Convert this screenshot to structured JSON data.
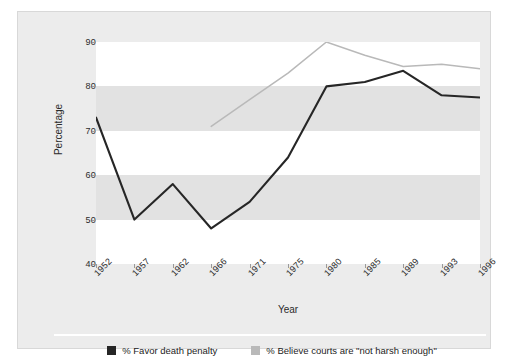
{
  "chart_data": {
    "type": "line",
    "title": "",
    "xlabel": "Year",
    "ylabel": "Percentage",
    "categories": [
      "1952",
      "1957",
      "1962",
      "1966",
      "1971",
      "1975",
      "1980",
      "1985",
      "1989",
      "1993",
      "1996"
    ],
    "ylim": [
      40,
      90
    ],
    "yticks": [
      40,
      50,
      60,
      70,
      80,
      90
    ],
    "grid": "horizontal-bands",
    "legend_position": "bottom",
    "series": [
      {
        "name": "% Favor death penalty",
        "color": "#262626",
        "values": [
          73,
          50,
          58,
          48,
          54,
          64,
          80,
          81,
          83.5,
          78,
          77.5
        ]
      },
      {
        "name": "% Believe courts are \"not harsh enough\"",
        "color": "#b9b9b9",
        "values": [
          null,
          null,
          null,
          71,
          77,
          83,
          90,
          87,
          84.5,
          85,
          84
        ]
      }
    ]
  },
  "legend": {
    "items": [
      {
        "label": "% Favor death penalty",
        "color": "#262626"
      },
      {
        "label": "% Believe courts are \"not harsh enough\"",
        "color": "#b9b9b9"
      }
    ]
  },
  "colors": {
    "panel_background": "#ececec",
    "band_gray": "#e2e2e2",
    "band_white": "#ffffff",
    "series_dark": "#262626",
    "series_light": "#b9b9b9",
    "text": "#2b2b2b"
  }
}
